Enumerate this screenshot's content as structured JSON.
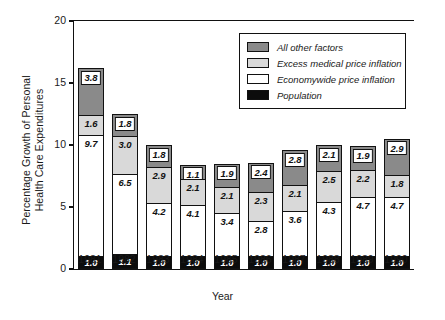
{
  "chart_data": {
    "type": "bar",
    "stacked": true,
    "title": "",
    "xlabel": "Year",
    "ylabel": "Percentage Growth of Personal Health Care Expenditures",
    "ylabel_lines": [
      "Percentage Growth of Personal",
      "Health Care Expenditures"
    ],
    "ylim": [
      0,
      20
    ],
    "yticks": [
      0,
      5,
      10,
      15,
      20
    ],
    "ytick_labels": [
      "0",
      "5",
      "10",
      "15",
      "20"
    ],
    "grid": false,
    "legend_position": "top-right",
    "categories": [
      "1981",
      "1982",
      "1983",
      "1984",
      "1985",
      "1986",
      "1987",
      "1988",
      "1989",
      "1990"
    ],
    "series": [
      {
        "name": "Population",
        "key": "pop",
        "color": "#0c0c0c",
        "values": [
          1.0,
          1.1,
          1.0,
          1.0,
          1.0,
          1.0,
          1.0,
          1.0,
          1.0,
          1.0
        ],
        "labels": [
          "1.0",
          "1.1",
          "1.0",
          "1.0",
          "1.0",
          "1.0",
          "1.0",
          "1.0",
          "1.0",
          "1.0"
        ]
      },
      {
        "name": "Economywide price inflation",
        "key": "econ",
        "color": "#ffffff",
        "values": [
          9.7,
          6.5,
          4.2,
          4.1,
          3.4,
          2.8,
          3.6,
          4.3,
          4.7,
          4.7
        ],
        "labels": [
          "9.7",
          "6.5",
          "4.2",
          "4.1",
          "3.4",
          "2.8",
          "3.6",
          "4.3",
          "4.7",
          "4.7"
        ]
      },
      {
        "name": "Excess medical price inflation",
        "key": "excess",
        "color": "#d9d9d9",
        "values": [
          1.6,
          3.0,
          2.9,
          2.1,
          2.1,
          2.3,
          2.1,
          2.5,
          2.2,
          1.8
        ],
        "labels": [
          "1.6",
          "3.0",
          "2.9",
          "2.1",
          "2.1",
          "2.3",
          "2.1",
          "2.5",
          "2.2",
          "1.8"
        ]
      },
      {
        "name": "All other factors",
        "key": "other",
        "color": "#8a8a8a",
        "values": [
          3.8,
          1.8,
          1.8,
          1.1,
          1.9,
          2.4,
          2.8,
          2.1,
          1.9,
          2.9
        ],
        "labels": [
          "3.8",
          "1.8",
          "1.8",
          "1.1",
          "1.9",
          "2.4",
          "2.8",
          "2.1",
          "1.9",
          "2.9"
        ]
      }
    ],
    "totals": [
      16.1,
      12.4,
      9.9,
      8.3,
      8.4,
      8.5,
      9.5,
      9.9,
      9.8,
      10.4
    ]
  },
  "legend": {
    "items": [
      {
        "label": "All other factors",
        "key": "other"
      },
      {
        "label": "Excess medical price inflation",
        "key": "excess"
      },
      {
        "label": "Economywide price inflation",
        "key": "econ"
      },
      {
        "label": "Population",
        "key": "pop"
      }
    ]
  },
  "colors": {
    "all_other_factors": "#8a8a8a",
    "excess_medical_price_inflation": "#d9d9d9",
    "economywide_price_inflation": "#ffffff",
    "population": "#0c0c0c",
    "axis": "#111111",
    "background": "#ffffff"
  }
}
